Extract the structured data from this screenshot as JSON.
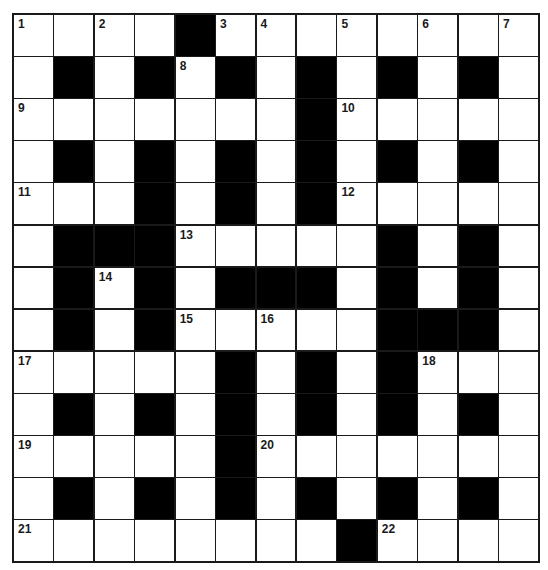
{
  "puzzle": {
    "rows": 13,
    "cols": 13,
    "colors": {
      "black": "#000000",
      "white": "#ffffff",
      "line": "#1a1a1a"
    },
    "grid": [
      "WWWWBWWWWWWWW",
      "WBWBWBWBWBWBW",
      "WWWWWWWBWWWWW",
      "WBWBWBWBWBWBW",
      "WWWBWBWBWWWWW",
      "WBBBWWWWWBWBW",
      "WBWBWBBBWBWBW",
      "WBWBWWWWWBBBW",
      "WWWWWBWBWBWWW",
      "WBWBWBWBWBWBW",
      "WWWWWBWWWWWWW",
      "WBWBWBWBWBWBW",
      "WWWWWWWWBWWWW"
    ],
    "numbers": [
      {
        "r": 0,
        "c": 0,
        "n": "1"
      },
      {
        "r": 0,
        "c": 2,
        "n": "2"
      },
      {
        "r": 0,
        "c": 5,
        "n": "3"
      },
      {
        "r": 0,
        "c": 6,
        "n": "4"
      },
      {
        "r": 0,
        "c": 8,
        "n": "5"
      },
      {
        "r": 0,
        "c": 10,
        "n": "6"
      },
      {
        "r": 0,
        "c": 12,
        "n": "7"
      },
      {
        "r": 1,
        "c": 4,
        "n": "8"
      },
      {
        "r": 2,
        "c": 0,
        "n": "9"
      },
      {
        "r": 2,
        "c": 8,
        "n": "10"
      },
      {
        "r": 4,
        "c": 0,
        "n": "11"
      },
      {
        "r": 4,
        "c": 8,
        "n": "12"
      },
      {
        "r": 5,
        "c": 4,
        "n": "13"
      },
      {
        "r": 6,
        "c": 2,
        "n": "14"
      },
      {
        "r": 7,
        "c": 4,
        "n": "15"
      },
      {
        "r": 7,
        "c": 6,
        "n": "16"
      },
      {
        "r": 8,
        "c": 0,
        "n": "17"
      },
      {
        "r": 8,
        "c": 10,
        "n": "18"
      },
      {
        "r": 10,
        "c": 0,
        "n": "19"
      },
      {
        "r": 10,
        "c": 6,
        "n": "20"
      },
      {
        "r": 12,
        "c": 0,
        "n": "21"
      },
      {
        "r": 12,
        "c": 9,
        "n": "22"
      }
    ]
  }
}
